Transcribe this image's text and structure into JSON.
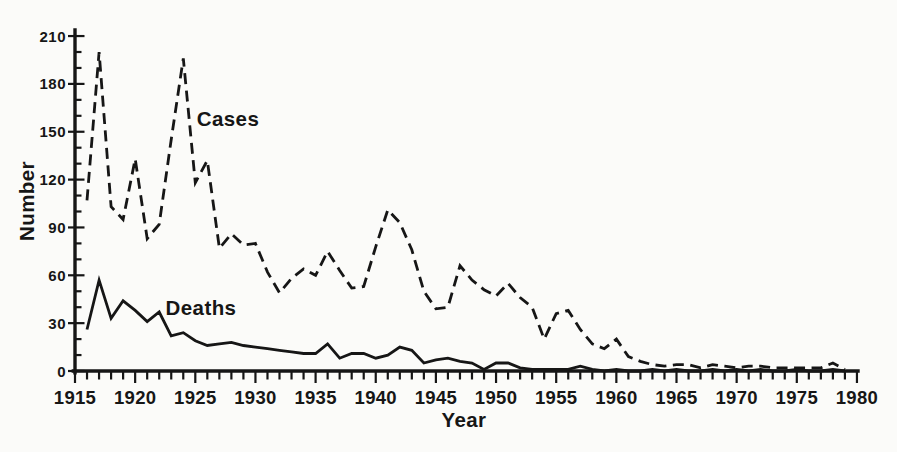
{
  "figure": {
    "background_color": "#fbfbf9",
    "ink_color": "#161616"
  },
  "chart_data": {
    "type": "line",
    "title": "",
    "xlabel": "Year",
    "ylabel": "Number",
    "xlim": [
      1915,
      1980
    ],
    "ylim": [
      0,
      210
    ],
    "grid": false,
    "legend_position": "inline-annotations",
    "x_major_ticks": [
      1915,
      1920,
      1925,
      1930,
      1935,
      1940,
      1945,
      1950,
      1955,
      1960,
      1965,
      1970,
      1975,
      1980
    ],
    "x_minor_step": 1,
    "y_major_ticks": [
      0,
      30,
      60,
      90,
      120,
      150,
      180,
      210
    ],
    "y_minor_step": 10,
    "series_labels": {
      "cases": "Cases",
      "deaths": "Deaths"
    },
    "x": [
      1916,
      1917,
      1918,
      1919,
      1920,
      1921,
      1922,
      1923,
      1924,
      1925,
      1926,
      1927,
      1928,
      1929,
      1930,
      1931,
      1932,
      1933,
      1934,
      1935,
      1936,
      1937,
      1938,
      1939,
      1940,
      1941,
      1942,
      1943,
      1944,
      1945,
      1946,
      1947,
      1948,
      1949,
      1950,
      1951,
      1952,
      1953,
      1954,
      1955,
      1956,
      1957,
      1958,
      1959,
      1960,
      1961,
      1962,
      1963,
      1964,
      1965,
      1966,
      1967,
      1968,
      1969,
      1970,
      1971,
      1972,
      1973,
      1974,
      1975,
      1976,
      1977,
      1978,
      1979
    ],
    "series": [
      {
        "name": "Cases",
        "line_style": "dashed",
        "values": [
          107,
          200,
          103,
          95,
          133,
          83,
          92,
          145,
          196,
          118,
          132,
          77,
          86,
          79,
          80,
          62,
          49,
          58,
          64,
          60,
          75,
          63,
          52,
          53,
          78,
          101,
          93,
          76,
          50,
          39,
          40,
          66,
          57,
          51,
          47,
          55,
          46,
          40,
          20,
          36,
          38,
          26,
          17,
          14,
          20,
          9,
          6,
          4,
          3,
          4,
          4,
          2,
          4,
          3,
          2,
          3,
          3,
          2,
          2,
          2,
          2,
          2,
          5,
          1
        ]
      },
      {
        "name": "Deaths",
        "line_style": "solid",
        "values": [
          26,
          57,
          33,
          44,
          38,
          31,
          37,
          22,
          24,
          19,
          16,
          17,
          18,
          16,
          15,
          14,
          13,
          12,
          11,
          11,
          17,
          8,
          11,
          11,
          8,
          10,
          15,
          13,
          5,
          7,
          8,
          6,
          5,
          1,
          5,
          5,
          2,
          1,
          1,
          1,
          1,
          3,
          1,
          0,
          1,
          0,
          0,
          1,
          0,
          1,
          0,
          0,
          1,
          0,
          1,
          0,
          1,
          0,
          0,
          1,
          0,
          0,
          1,
          0
        ]
      }
    ]
  }
}
